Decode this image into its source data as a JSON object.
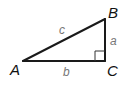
{
  "diagram": {
    "colors": {
      "line": "#1a1a1a",
      "vertex_label": "#111111",
      "side_label": "#777777",
      "background": "#ffffff"
    },
    "vertices": [
      {
        "name": "A",
        "label": "A",
        "x": 23,
        "y": 61
      },
      {
        "name": "B",
        "label": "B",
        "x": 105,
        "y": 19
      },
      {
        "name": "C",
        "label": "C",
        "x": 105,
        "y": 61
      }
    ],
    "sides": [
      {
        "name": "c",
        "label": "c",
        "from": "A",
        "to": "B"
      },
      {
        "name": "a",
        "label": "a",
        "from": "B",
        "to": "C"
      },
      {
        "name": "b",
        "label": "b",
        "from": "A",
        "to": "C"
      }
    ],
    "right_angle_at": "C"
  }
}
